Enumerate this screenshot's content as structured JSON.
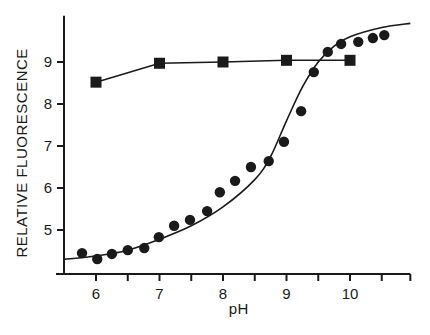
{
  "chart_data": {
    "type": "scatter",
    "title": "",
    "xlabel": "pH",
    "ylabel": "RELATIVE FLUORESCENCE",
    "xlim": [
      5.5,
      10.95
    ],
    "ylim": [
      3.95,
      10.1
    ],
    "xticks": [
      6,
      7,
      8,
      9,
      10
    ],
    "xminor_ticks": [
      6.5,
      7.5,
      8.5,
      9.5,
      10.5,
      10.95
    ],
    "yticks": [
      5,
      6,
      7,
      8,
      9
    ],
    "grid": false,
    "legend": null,
    "series": [
      {
        "name": "squares",
        "marker": "square",
        "line": "connected",
        "x": [
          6.0,
          7.0,
          8.0,
          9.0,
          10.0
        ],
        "y": [
          8.52,
          8.97,
          9.0,
          9.04,
          9.04
        ]
      },
      {
        "name": "circles",
        "marker": "circle",
        "line": "none",
        "x": [
          5.78,
          6.02,
          6.25,
          6.5,
          6.76,
          6.99,
          7.23,
          7.48,
          7.75,
          7.95,
          8.19,
          8.44,
          8.72,
          8.96,
          9.23,
          9.43,
          9.65,
          9.86,
          10.13,
          10.36,
          10.54
        ],
        "y": [
          4.45,
          4.31,
          4.43,
          4.52,
          4.57,
          4.83,
          5.1,
          5.24,
          5.45,
          5.9,
          6.17,
          6.5,
          6.64,
          7.1,
          7.83,
          8.76,
          9.24,
          9.43,
          9.48,
          9.57,
          9.64
        ]
      },
      {
        "name": "fitted-curve",
        "marker": "none",
        "line": "smooth",
        "x": [
          5.5,
          6.0,
          6.5,
          7.0,
          7.5,
          8.0,
          8.5,
          8.75,
          9.0,
          9.25,
          9.5,
          9.75,
          10.0,
          10.5,
          10.95
        ],
        "y": [
          4.3,
          4.38,
          4.52,
          4.78,
          5.1,
          5.55,
          6.2,
          6.75,
          7.6,
          8.4,
          9.0,
          9.38,
          9.6,
          9.82,
          9.92
        ]
      }
    ],
    "colors": {
      "ink": "#1a1a1a",
      "background": "#ffffff"
    }
  }
}
